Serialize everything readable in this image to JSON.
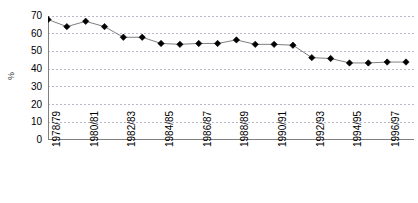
{
  "chart_data": {
    "type": "line",
    "title": "",
    "xlabel": "",
    "ylabel": "%",
    "ylim": [
      0,
      70
    ],
    "ytick_values": [
      0,
      10,
      20,
      30,
      40,
      50,
      60,
      70
    ],
    "grid": true,
    "legend": false,
    "marker": "diamond",
    "line_color": "#808080",
    "marker_color": "#000000",
    "grid_color": "#b8b8c8",
    "axis_color": "#808080",
    "categories": [
      "1978/79",
      "1979/80",
      "1980/81",
      "1981/82",
      "1982/83",
      "1983/84",
      "1984/85",
      "1985/86",
      "1986/87",
      "1987/88",
      "1988/89",
      "1989/90",
      "1990/91",
      "1991/92",
      "1992/93",
      "1993/94",
      "1994/95",
      "1995/96",
      "1996/97",
      "1997/98"
    ],
    "xtick_labels_shown": [
      "1978/79",
      "1980/81",
      "1982/83",
      "1984/85",
      "1986/87",
      "1988/89",
      "1990/91",
      "1992/93",
      "1994/95",
      "1996/97"
    ],
    "values": [
      68.0,
      64.0,
      67.0,
      64.0,
      58.0,
      58.0,
      54.5,
      54.0,
      54.5,
      54.5,
      56.5,
      54.0,
      54.0,
      53.5,
      46.5,
      46.0,
      43.5,
      43.5,
      44.0,
      44.0
    ]
  }
}
